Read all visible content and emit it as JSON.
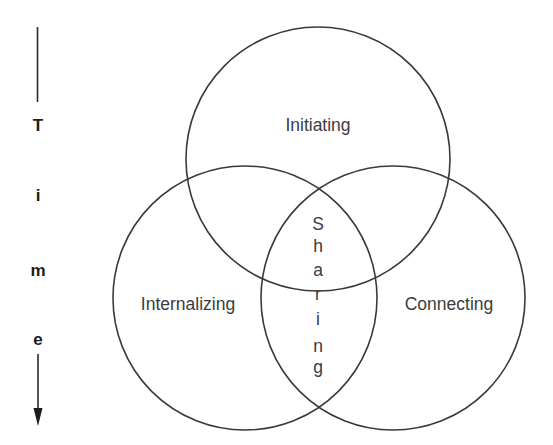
{
  "diagram": {
    "type": "venn",
    "circles": [
      {
        "id": "initiating",
        "label": "Initiating",
        "cx": 318,
        "cy": 159,
        "r": 132
      },
      {
        "id": "internalizing",
        "label": "Internalizing",
        "cx": 245,
        "cy": 298,
        "r": 132
      },
      {
        "id": "connecting",
        "label": "Connecting",
        "cx": 393,
        "cy": 298,
        "r": 132
      }
    ],
    "center_label": {
      "text": "Sharing",
      "letters": [
        "S",
        "h",
        "a",
        "r",
        "i",
        "n",
        "g"
      ]
    },
    "time_axis": {
      "label": "Time",
      "letters": [
        "T",
        "i",
        "m",
        "e"
      ],
      "direction": "down"
    },
    "colors": {
      "stroke": "#3a3a3a",
      "text": "#3c3c3c",
      "axis_text": "#1c1c1c",
      "background": "#ffffff"
    }
  }
}
